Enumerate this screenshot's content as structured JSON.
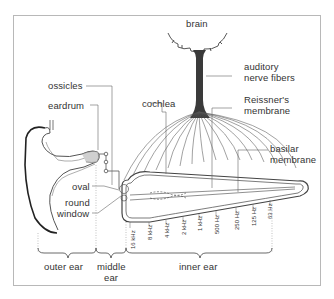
{
  "diagram": {
    "labels": {
      "brain": "brain",
      "auditory_nerve_1": "auditory",
      "auditory_nerve_2": "nerve fibers",
      "cochlea": "cochlea",
      "reissners_1": "Reissner's",
      "reissners_2": "membrane",
      "basilar_1": "basilar",
      "basilar_2": "membrane",
      "ossicles": "ossicles",
      "eardrum": "eardrum",
      "oval": "oval",
      "round_window_1": "round",
      "round_window_2": "window"
    },
    "frequencies": [
      "16 kHz",
      "8 kHz",
      "4 kHz",
      "2 kHz",
      "1 kHz",
      "500 Hz",
      "250 Hz",
      "125 Hz",
      "63 Hz"
    ],
    "sections": {
      "outer_ear": "outer ear",
      "middle_ear_1": "middle",
      "middle_ear_2": "ear",
      "inner_ear": "inner ear"
    },
    "colors": {
      "line": "#555555",
      "dark": "#222222",
      "frame": "#b8b8b8",
      "text": "#333333"
    }
  }
}
